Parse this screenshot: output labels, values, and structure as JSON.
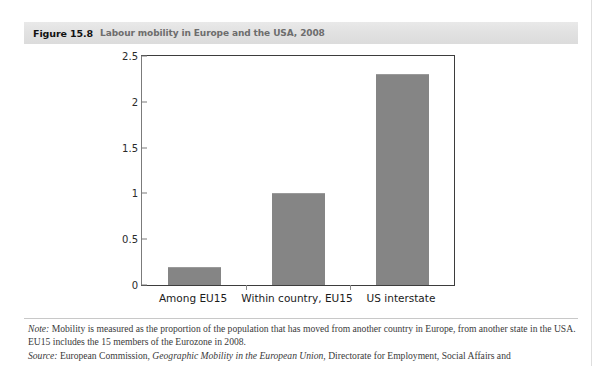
{
  "figure": {
    "number": "Figure 15.8",
    "caption": "Labour mobility in Europe and the USA, 2008"
  },
  "notes": {
    "note_lead": "Note:",
    "note_text": " Mobility is measured as the proportion of the population that has moved from another country in Europe, from another state in the USA. EU15 includes the 15 members of the Eurozone in 2008.",
    "source_lead": "Source:",
    "source_pre": " European Commission, ",
    "source_title": "Geographic Mobility in the European Union",
    "source_post": ", Directorate for Employment, Social Affairs and"
  },
  "chart_data": {
    "type": "bar",
    "title": "Labour mobility in Europe and the USA, 2008",
    "categories": [
      "Among EU15",
      "Within country, EU15",
      "US interstate"
    ],
    "values": [
      0.2,
      1.0,
      2.3
    ],
    "series": [
      {
        "name": "Mobility (% of population)",
        "values": [
          0.2,
          1.0,
          2.3
        ]
      }
    ],
    "xlabel": "",
    "ylabel": "",
    "ylim": [
      0,
      2.5
    ],
    "yticks": [
      0,
      0.5,
      1,
      1.5,
      2,
      2.5
    ],
    "ytick_labels": [
      "0",
      "0.5",
      "1",
      "1.5",
      "2",
      "2.5"
    ],
    "grid": false,
    "legend": false,
    "bar_color": "#858585"
  }
}
